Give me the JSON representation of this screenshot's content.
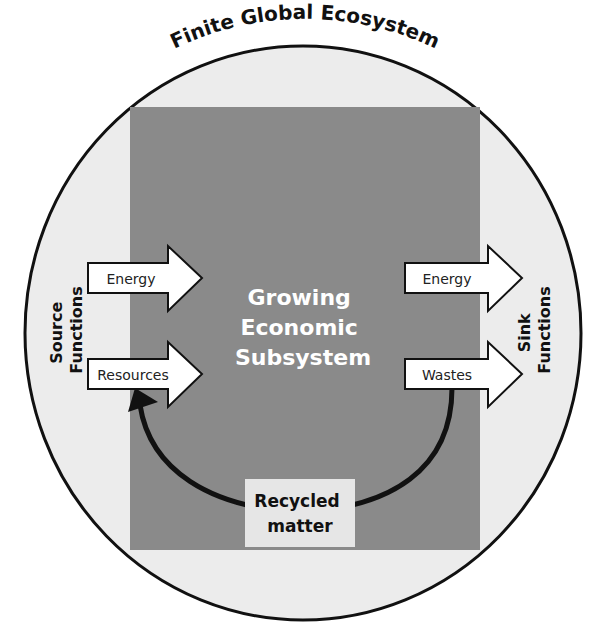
{
  "diagram": {
    "title": "Finite Global Ecosystem",
    "center_label": [
      "Growing",
      "Economic",
      "Subsystem"
    ],
    "source_label": [
      "Source",
      "Functions"
    ],
    "sink_label": [
      "Sink",
      "Functions"
    ],
    "inflows": [
      {
        "label": "Energy"
      },
      {
        "label": "Resources"
      }
    ],
    "outflows": [
      {
        "label": "Energy"
      },
      {
        "label": "Wastes"
      }
    ],
    "recycle_label": [
      "Recycled",
      "matter"
    ],
    "colors": {
      "ecosystem_fill": "#ececec",
      "subsystem_fill": "#8a8a8a",
      "arrow_fill": "#ffffff",
      "stroke": "#111111",
      "recycle_box": "#e6e6e6",
      "center_text": "#ffffff"
    }
  }
}
